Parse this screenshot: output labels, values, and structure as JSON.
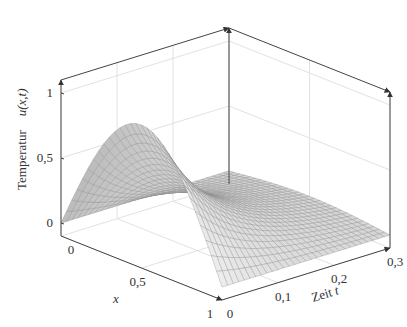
{
  "chart_data": {
    "type": "surface",
    "function": "u(x,t) = sin(pi*x) * exp(-pi^2 * t)",
    "x": {
      "label": "x",
      "range": [
        0,
        1
      ],
      "ticks": [
        0,
        0.5,
        1
      ],
      "tick_labels": [
        "0",
        "0,5",
        "1"
      ]
    },
    "t": {
      "label": "Zeit t",
      "label_text": "Zeit",
      "label_var": "t",
      "range": [
        0,
        0.3
      ],
      "ticks": [
        0,
        0.1,
        0.2,
        0.3
      ],
      "tick_labels": [
        "0",
        "0,1",
        "0,2",
        "0,3"
      ]
    },
    "z": {
      "label": "Temperatur u(x,t)",
      "label_text": "Temperatur",
      "label_var": "u(x,t)",
      "range": [
        -0.1,
        1.1
      ],
      "ticks": [
        0,
        0.5,
        1
      ],
      "tick_labels": [
        "0",
        "0,5",
        "1"
      ]
    },
    "mesh": {
      "nx": 30,
      "nt": 30
    },
    "surface_color": "#d6d6d6",
    "mesh_color": "#8c8c8c",
    "grid": true,
    "sample_values": [
      {
        "x": 0.5,
        "t": 0,
        "u": 1.0
      },
      {
        "x": 0.5,
        "t": 0.1,
        "u": 0.373
      },
      {
        "x": 0.5,
        "t": 0.2,
        "u": 0.139
      },
      {
        "x": 0.5,
        "t": 0.3,
        "u": 0.052
      }
    ]
  }
}
